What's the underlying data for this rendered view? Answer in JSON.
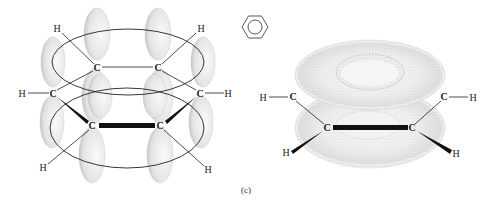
{
  "figure": {
    "caption": "(c)",
    "benzene_symbol": "benzene-ring-icon"
  },
  "left_diagram": {
    "title": "p-orbital overlap in benzene",
    "carbons": [
      {
        "label": "C",
        "x": 97,
        "y": 68
      },
      {
        "label": "C",
        "x": 158,
        "y": 68
      },
      {
        "label": "C",
        "x": 53,
        "y": 94
      },
      {
        "label": "C",
        "x": 200,
        "y": 94
      },
      {
        "label": "C",
        "x": 92,
        "y": 126
      },
      {
        "label": "C",
        "x": 160,
        "y": 126
      }
    ],
    "hydrogens": [
      {
        "label": "H",
        "x": 57,
        "y": 30
      },
      {
        "label": "H",
        "x": 201,
        "y": 30
      },
      {
        "label": "H",
        "x": 22,
        "y": 96
      },
      {
        "label": "H",
        "x": 228,
        "y": 96
      },
      {
        "label": "H",
        "x": 43,
        "y": 170
      },
      {
        "label": "H",
        "x": 208,
        "y": 172
      }
    ]
  },
  "right_diagram": {
    "title": "pi electron cloud torus",
    "carbons": [
      {
        "label": "C",
        "x": 293,
        "y": 99
      },
      {
        "label": "C",
        "x": 444,
        "y": 99
      },
      {
        "label": "C",
        "x": 327,
        "y": 130
      },
      {
        "label": "C",
        "x": 412,
        "y": 130
      }
    ],
    "hydrogens": [
      {
        "label": "H",
        "x": 263,
        "y": 100
      },
      {
        "label": "H",
        "x": 473,
        "y": 100
      },
      {
        "label": "H",
        "x": 286,
        "y": 155
      },
      {
        "label": "H",
        "x": 456,
        "y": 156
      }
    ]
  },
  "colors": {
    "line": "#222222",
    "orbital_fill": "#e9e9e9",
    "orbital_stipple": "#9a9a9a",
    "background": "#ffffff"
  }
}
